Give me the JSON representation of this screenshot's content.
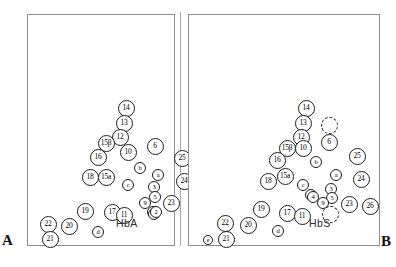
{
  "figure": {
    "panel_a": {
      "letter": "A",
      "caption": "HbA",
      "nodes": [
        {
          "label": "14",
          "x": 98,
          "y": 93,
          "size": "big",
          "style": "solid"
        },
        {
          "label": "13",
          "x": 96,
          "y": 108,
          "size": "big",
          "style": "solid"
        },
        {
          "label": "12",
          "x": 92,
          "y": 122,
          "size": "big",
          "style": "solid"
        },
        {
          "label": "15β",
          "x": 78,
          "y": 128,
          "size": "big",
          "style": "solid"
        },
        {
          "label": "10",
          "x": 100,
          "y": 137,
          "size": "big",
          "style": "solid"
        },
        {
          "label": "16",
          "x": 70,
          "y": 142,
          "size": "big",
          "style": "solid"
        },
        {
          "label": "6",
          "x": 127,
          "y": 131,
          "size": "big",
          "style": "solid"
        },
        {
          "label": "25",
          "x": 154,
          "y": 143,
          "size": "big",
          "style": "solid"
        },
        {
          "label": "b",
          "x": 112,
          "y": 153,
          "size": "small",
          "style": "solid"
        },
        {
          "label": "18",
          "x": 62,
          "y": 162,
          "size": "big",
          "style": "solid"
        },
        {
          "label": "15a",
          "x": 78,
          "y": 162,
          "size": "big",
          "style": "solid"
        },
        {
          "label": "a",
          "x": 130,
          "y": 160,
          "size": "small",
          "style": "solid"
        },
        {
          "label": "24",
          "x": 156,
          "y": 166,
          "size": "big",
          "style": "solid"
        },
        {
          "label": "c",
          "x": 100,
          "y": 170,
          "size": "small",
          "style": "solid"
        },
        {
          "label": "3",
          "x": 126,
          "y": 172,
          "size": "small",
          "style": "solid"
        },
        {
          "label": "5",
          "x": 127,
          "y": 182,
          "size": "small",
          "style": "solid"
        },
        {
          "label": "9",
          "x": 117,
          "y": 188,
          "size": "small",
          "style": "solid"
        },
        {
          "label": "23",
          "x": 143,
          "y": 188,
          "size": "big",
          "style": "solid"
        },
        {
          "label": "26",
          "x": 168,
          "y": 192,
          "size": "big",
          "style": "solid"
        },
        {
          "label": "19",
          "x": 57,
          "y": 196,
          "size": "big",
          "style": "solid"
        },
        {
          "label": "17",
          "x": 84,
          "y": 197,
          "size": "big",
          "style": "solid"
        },
        {
          "label": "11",
          "x": 96,
          "y": 200,
          "size": "big",
          "style": "solid"
        },
        {
          "label": "1",
          "x": 125,
          "y": 197,
          "size": "small",
          "style": "solid"
        },
        {
          "label": "4",
          "x": 126,
          "y": 199,
          "size": "small",
          "style": "solid"
        },
        {
          "label": "2",
          "x": 128,
          "y": 197,
          "size": "small",
          "style": "solid"
        },
        {
          "label": "22",
          "x": 20,
          "y": 209,
          "size": "big",
          "style": "solid"
        },
        {
          "label": "20",
          "x": 41,
          "y": 211,
          "size": "big",
          "style": "solid"
        },
        {
          "label": "d",
          "x": 70,
          "y": 217,
          "size": "small",
          "style": "solid"
        },
        {
          "label": "21",
          "x": 22,
          "y": 224,
          "size": "big",
          "style": "solid"
        }
      ]
    },
    "panel_b": {
      "letter": "B",
      "caption": "HbS",
      "nodes": [
        {
          "label": "14",
          "x": 117,
          "y": 93,
          "size": "big",
          "style": "solid"
        },
        {
          "label": "13",
          "x": 114,
          "y": 108,
          "size": "big",
          "style": "solid"
        },
        {
          "label": "",
          "x": 140,
          "y": 110,
          "size": "big",
          "style": "dashed"
        },
        {
          "label": "12",
          "x": 112,
          "y": 122,
          "size": "big",
          "style": "solid"
        },
        {
          "label": "6",
          "x": 140,
          "y": 127,
          "size": "big",
          "style": "solid"
        },
        {
          "label": "15β",
          "x": 98,
          "y": 133,
          "size": "big",
          "style": "solid"
        },
        {
          "label": "10",
          "x": 114,
          "y": 133,
          "size": "big",
          "style": "solid"
        },
        {
          "label": "25",
          "x": 168,
          "y": 141,
          "size": "big",
          "style": "solid"
        },
        {
          "label": "16",
          "x": 88,
          "y": 145,
          "size": "big",
          "style": "solid"
        },
        {
          "label": "b",
          "x": 127,
          "y": 147,
          "size": "small",
          "style": "solid"
        },
        {
          "label": "15a",
          "x": 96,
          "y": 161,
          "size": "big",
          "style": "solid"
        },
        {
          "label": "a",
          "x": 147,
          "y": 160,
          "size": "small",
          "style": "solid"
        },
        {
          "label": "18",
          "x": 79,
          "y": 166,
          "size": "big",
          "style": "solid"
        },
        {
          "label": "24",
          "x": 172,
          "y": 164,
          "size": "big",
          "style": "solid"
        },
        {
          "label": "c",
          "x": 114,
          "y": 170,
          "size": "small",
          "style": "solid"
        },
        {
          "label": "3",
          "x": 142,
          "y": 174,
          "size": "small",
          "style": "solid"
        },
        {
          "label": "1",
          "x": 122,
          "y": 180,
          "size": "small",
          "style": "solid"
        },
        {
          "label": "4",
          "x": 124,
          "y": 182,
          "size": "small",
          "style": "solid"
        },
        {
          "label": "5",
          "x": 143,
          "y": 183,
          "size": "small",
          "style": "solid"
        },
        {
          "label": "9",
          "x": 134,
          "y": 188,
          "size": "small",
          "style": "solid"
        },
        {
          "label": "23",
          "x": 160,
          "y": 189,
          "size": "big",
          "style": "solid"
        },
        {
          "label": "26",
          "x": 181,
          "y": 191,
          "size": "big",
          "style": "solid"
        },
        {
          "label": "19",
          "x": 72,
          "y": 194,
          "size": "big",
          "style": "solid"
        },
        {
          "label": "17",
          "x": 98,
          "y": 198,
          "size": "big",
          "style": "solid"
        },
        {
          "label": "11",
          "x": 113,
          "y": 201,
          "size": "big",
          "style": "solid"
        },
        {
          "label": "",
          "x": 141,
          "y": 199,
          "size": "big",
          "style": "dashed"
        },
        {
          "label": "22",
          "x": 36,
          "y": 208,
          "size": "big",
          "style": "solid"
        },
        {
          "label": "20",
          "x": 59,
          "y": 210,
          "size": "big",
          "style": "solid"
        },
        {
          "label": "d",
          "x": 89,
          "y": 216,
          "size": "small",
          "style": "solid"
        },
        {
          "label": "e",
          "x": 19,
          "y": 225,
          "size": "tiny",
          "style": "solid"
        },
        {
          "label": "21",
          "x": 37,
          "y": 224,
          "size": "big",
          "style": "solid"
        }
      ]
    }
  }
}
